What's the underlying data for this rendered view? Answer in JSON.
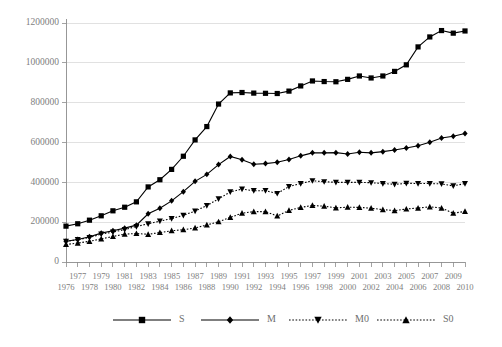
{
  "chart_data": {
    "type": "line",
    "title": "",
    "subtitle": "",
    "xlabel": "",
    "ylabel": "",
    "grid": true,
    "legend_position": "bottom",
    "ylim": [
      0,
      1200000
    ],
    "yticks": [
      0,
      200000,
      400000,
      600000,
      800000,
      1000000,
      1200000
    ],
    "ytick_labels": [
      "0",
      "200000",
      "400000",
      "600000",
      "800000",
      "1000000",
      "1200000"
    ],
    "x": [
      1976,
      1977,
      1978,
      1979,
      1980,
      1981,
      1982,
      1983,
      1984,
      1985,
      1986,
      1987,
      1988,
      1989,
      1990,
      1991,
      1992,
      1993,
      1994,
      1995,
      1996,
      1997,
      1998,
      1999,
      2000,
      2001,
      2002,
      2003,
      2004,
      2005,
      2006,
      2007,
      2008,
      2009,
      2010
    ],
    "xtick_labels_top": [
      "",
      "1977",
      "",
      "1979",
      "",
      "1981",
      "",
      "1983",
      "",
      "1985",
      "",
      "1987",
      "",
      "1989",
      "",
      "1991",
      "",
      "1993",
      "",
      "1995",
      "",
      "1997",
      "",
      "1999",
      "",
      "2001",
      "",
      "2003",
      "",
      "2005",
      "",
      "2007",
      "",
      "2009",
      ""
    ],
    "xtick_labels_bottom": [
      "1976",
      "",
      "1978",
      "",
      "1980",
      "",
      "1982",
      "",
      "1984",
      "",
      "1986",
      "",
      "1988",
      "",
      "1990",
      "",
      "1992",
      "",
      "1994",
      "",
      "1996",
      "",
      "1998",
      "",
      "2000",
      "",
      "2002",
      "",
      "2004",
      "",
      "2006",
      "",
      "2008",
      "",
      "2010"
    ],
    "series": [
      {
        "name": "S",
        "marker": "square",
        "line_style": "solid",
        "color": "#000000",
        "values": [
          180000,
          192000,
          210000,
          232000,
          257000,
          275000,
          302000,
          377000,
          413000,
          465000,
          531000,
          613000,
          680000,
          793000,
          849000,
          851000,
          848000,
          847000,
          846000,
          858000,
          884000,
          909000,
          906000,
          905000,
          917000,
          934000,
          924000,
          934000,
          957000,
          990000,
          1080000,
          1130000,
          1162000,
          1149000,
          1160000
        ]
      },
      {
        "name": "M",
        "marker": "diamond",
        "line_style": "solid",
        "color": "#000000",
        "values": [
          104000,
          113000,
          127000,
          145000,
          157000,
          170000,
          185000,
          242000,
          270000,
          307000,
          353000,
          405000,
          440000,
          489000,
          530000,
          513000,
          491000,
          494000,
          501000,
          515000,
          533000,
          548000,
          548000,
          549000,
          542000,
          551000,
          548000,
          554000,
          562000,
          572000,
          584000,
          601000,
          623000,
          631000,
          645000
        ]
      },
      {
        "name": "M0",
        "marker": "triangle-down",
        "line_style": "dotted",
        "color": "#000000",
        "values": [
          104000,
          112000,
          123000,
          140000,
          150000,
          163000,
          178000,
          192000,
          205000,
          218000,
          234000,
          256000,
          283000,
          317000,
          352000,
          366000,
          358000,
          358000,
          344000,
          379000,
          394000,
          408000,
          403000,
          400000,
          400000,
          400000,
          398000,
          394000,
          390000,
          395000,
          394000,
          394000,
          392000,
          382000,
          394000
        ]
      },
      {
        "name": "S0",
        "marker": "triangle-up",
        "line_style": "dotted",
        "color": "#000000",
        "values": [
          88000,
          95000,
          104000,
          116000,
          128000,
          140000,
          143000,
          139000,
          148000,
          157000,
          162000,
          171000,
          186000,
          202000,
          224000,
          245000,
          253000,
          253000,
          231000,
          259000,
          274000,
          284000,
          280000,
          272000,
          275000,
          274000,
          270000,
          263000,
          258000,
          266000,
          271000,
          277000,
          271000,
          245000,
          254000
        ]
      }
    ]
  },
  "legend": {
    "items": [
      {
        "label": "S",
        "marker": "square-marker",
        "line_style": "solid"
      },
      {
        "label": "M",
        "marker": "diamond-marker",
        "line_style": "solid"
      },
      {
        "label": "M0",
        "marker": "triangle-down-marker",
        "line_style": "dotted"
      },
      {
        "label": "S0",
        "marker": "triangle-up-marker",
        "line_style": "dotted"
      }
    ]
  }
}
